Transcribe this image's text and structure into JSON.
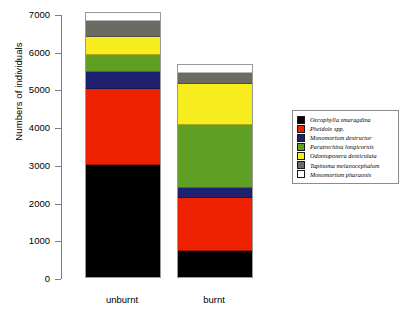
{
  "chart_data": {
    "type": "bar",
    "subtype": "stacked",
    "title": "",
    "xlabel": "",
    "ylabel": "Numbers of individuals",
    "categories": [
      "unburnt",
      "burnt"
    ],
    "ylim": [
      0,
      7000
    ],
    "yticks": [
      0,
      1000,
      2000,
      3000,
      4000,
      5000,
      6000,
      7000
    ],
    "ticklabels": [
      "0",
      "1000",
      "2000",
      "3000",
      "4000",
      "5000",
      "6000",
      "7000"
    ],
    "grid": false,
    "legend_position": "right",
    "totals": [
      7000,
      5620
    ],
    "series": [
      {
        "name": "Oecophylla smaragdina",
        "color": "#000000",
        "values": [
          2980,
          700
        ]
      },
      {
        "name": "Pheidole spp.",
        "color": "#ee2200",
        "values": [
          2010,
          1390
        ]
      },
      {
        "name": "Monomorium destructor",
        "color": "#1f2070",
        "values": [
          450,
          270
        ]
      },
      {
        "name": "Paratrechina longicornis",
        "color": "#5fa024",
        "values": [
          450,
          1660
        ]
      },
      {
        "name": "Odontoponera denticulata",
        "color": "#f7ec1e",
        "values": [
          470,
          1110
        ]
      },
      {
        "name": "Tapinoma melanocephalum",
        "color": "#6b6b63",
        "values": [
          420,
          270
        ]
      },
      {
        "name": "Monomorium pharaonis",
        "color": "#ffffff",
        "values": [
          220,
          220
        ]
      }
    ]
  }
}
